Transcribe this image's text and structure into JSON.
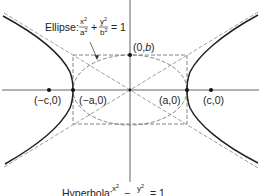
{
  "figure": {
    "type": "conic-sections-diagram",
    "colors": {
      "curve": "#222222",
      "axis": "#555555",
      "dashed": "#777777",
      "point": "#111111"
    }
  },
  "labels": {
    "ellipse_prefix": "Ellipse:",
    "ellipse_eq": {
      "x_num": "x",
      "x_exp": "2",
      "x_den": "a",
      "x_den_exp": "2",
      "plus": "+",
      "y_num": "y",
      "y_exp": "2",
      "y_den": "b",
      "y_den_exp": "2",
      "equals": "= 1"
    },
    "hyperbola_prefix": "Hyperbola:",
    "hyperbola_eq": {
      "x_num": "x",
      "x_exp": "2",
      "minus": "−",
      "y_num": "y",
      "y_exp": "2",
      "equals": "= 1"
    },
    "points": {
      "neg_c": "(−c,0)",
      "neg_a": "(−a,0)",
      "pos_a": "(a,0)",
      "pos_c": "(c,0)",
      "pos_b_prefix": "(0,",
      "pos_b_var": "b",
      "pos_b_suffix": ")"
    }
  },
  "geometry": {
    "center": [
      130,
      90
    ],
    "a_px": 57,
    "b_px": 35,
    "c_px": 81
  }
}
